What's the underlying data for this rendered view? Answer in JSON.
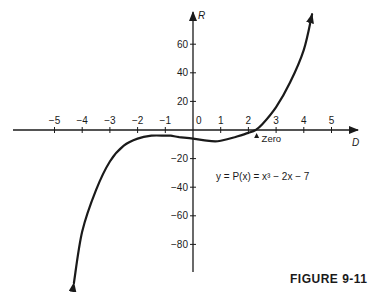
{
  "chart_data": {
    "type": "line",
    "title": "",
    "caption": "FIGURE 9-11",
    "xlabel": "D",
    "ylabel": "R",
    "equation": "y = P(x) = x³ − 2x − 7",
    "x_ticks": [
      -5,
      -4,
      -3,
      -2,
      -1,
      0,
      1,
      2,
      3,
      4,
      5
    ],
    "y_ticks": [
      60,
      40,
      20,
      -20,
      -40,
      -60,
      -80
    ],
    "xlim": [
      -6.5,
      6
    ],
    "ylim": [
      -100,
      82
    ],
    "grid": false,
    "annotations": [
      {
        "text": "Zero",
        "x": 2.26,
        "y": 0
      }
    ],
    "series": [
      {
        "name": "P(x) = x^3 - 2x - 7",
        "x": [
          -4.3,
          -4.0,
          -3.5,
          -3.0,
          -2.5,
          -2.0,
          -1.5,
          -1.0,
          -0.8,
          -0.5,
          0,
          0.5,
          0.8,
          1.0,
          1.5,
          2.0,
          2.26,
          2.5,
          3.0,
          3.5,
          4.0,
          4.3
        ],
        "y": [
          -107,
          -71,
          -42,
          -22,
          -11,
          -6,
          -4,
          -4,
          -4,
          -5,
          -6,
          -7.5,
          -8,
          -7.5,
          -5,
          -2,
          0,
          4,
          16,
          33,
          56,
          81
        ]
      }
    ]
  },
  "caption": "FIGURE 9-11"
}
